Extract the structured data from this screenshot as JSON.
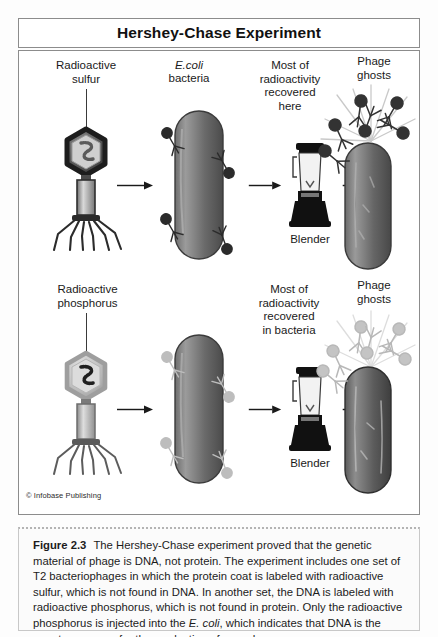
{
  "title": {
    "text": "Hershey-Chase Experiment"
  },
  "diagram": {
    "row1": {
      "label_phage": "Radioactive\nsulfur",
      "label_bacteria_line1": "E.coli",
      "label_bacteria_line2": "bacteria",
      "label_recovered": "Most of\nradioactivity\nrecovered\nhere",
      "label_ghosts": "Phage\nghosts",
      "label_blender": "Blender"
    },
    "row2": {
      "label_phage": "Radioactive\nphosphorus",
      "label_recovered": "Most of\nradioactivity\nrecovered\nin bacteria",
      "label_ghosts": "Phage\nghosts",
      "label_blender": "Blender"
    },
    "icons": {
      "phage": "bacteriophage-icon",
      "bacterium": "ecoli-bacterium-icon",
      "blender": "blender-icon",
      "arrow": "arrow-right-icon"
    }
  },
  "credit": {
    "text": "© Infobase Publishing"
  },
  "caption": {
    "figure_number": "Figure 2.3",
    "part1": "The Hershey-Chase experiment proved that the genetic material of phage is DNA, not protein. The experiment includes one set of T2 bacteriophages in which the protein coat is labeled with radioactive sulfur, which is not found in DNA. In another set, the DNA is labeled with radioactive phosphorus, which is not found in protein. Only the radioactive phosphorus is injected into the ",
    "organism": "E. coli",
    "part2": ", which indicates that DNA is the agent necessary for the production of new phages."
  },
  "colors": {
    "frame": "#8c8c8c",
    "bacterium_dark": "#5d5d5d",
    "bacterium_light": "#8e8e8e",
    "phage_dark": "#2a2a2a",
    "phage_light": "#b0b0b0",
    "text": "#1a1a1a"
  }
}
